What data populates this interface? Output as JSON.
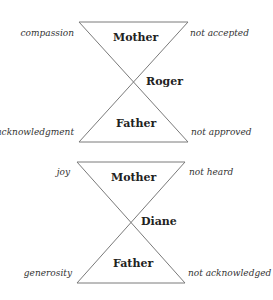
{
  "diagrams": [
    {
      "person": "Roger",
      "top": "Mother",
      "bottom": "Father",
      "top_left": "compassion",
      "top_right": "not accepted",
      "bottom_left": "acknowledgment",
      "bottom_right": "not approved"
    },
    {
      "person": "Diane",
      "top": "Mother",
      "bottom": "Father",
      "top_left": "joy",
      "top_right": "not heard",
      "bottom_left": "generosity",
      "bottom_right": "not acknowledged"
    }
  ],
  "colors": {
    "line": "#777777",
    "text": "#222222"
  }
}
